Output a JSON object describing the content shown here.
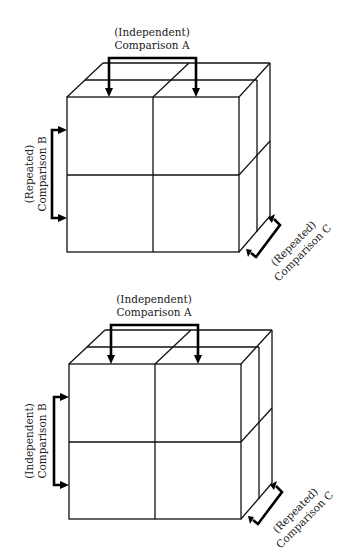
{
  "diagrams": [
    {
      "id": "top",
      "comparison_a": {
        "type": "(Independent)",
        "name": "Comparison A"
      },
      "comparison_b": {
        "type": "(Repeated)",
        "name": "Comparison B"
      },
      "comparison_c": {
        "type": "(Repeated)",
        "name": "Comparison C"
      }
    },
    {
      "id": "bottom",
      "comparison_a": {
        "type": "(Independent)",
        "name": "Comparison A"
      },
      "comparison_b": {
        "type": "(Independent)",
        "name": "Comparison B"
      },
      "comparison_c": {
        "type": "(Repeated)",
        "name": "Comparison C"
      }
    }
  ],
  "colors": {
    "line": "#111111",
    "bracket": "#000000",
    "text": "#222222",
    "background": "#ffffff"
  }
}
